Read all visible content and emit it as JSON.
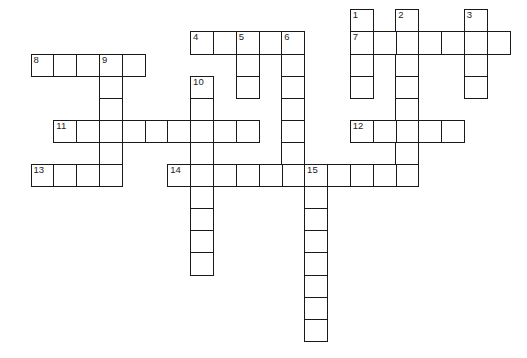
{
  "puzzle": {
    "grid": {
      "origin_x": 30.5,
      "origin_y": 9.3,
      "cell_width": 22.8,
      "cell_height": 22.1,
      "line_color": "#1a1a1a",
      "number_color": "#222222"
    },
    "entries": [
      {
        "number": "1",
        "direction": "down",
        "row": 0,
        "col": 14,
        "length": 4
      },
      {
        "number": "2",
        "direction": "down",
        "row": 0,
        "col": 16,
        "length": 8
      },
      {
        "number": "3",
        "direction": "down",
        "row": 0,
        "col": 19,
        "length": 4
      },
      {
        "number": "4",
        "direction": "across",
        "row": 1,
        "col": 7,
        "length": 5
      },
      {
        "number": "5",
        "direction": "down",
        "row": 1,
        "col": 9,
        "length": 3
      },
      {
        "number": "6",
        "direction": "down",
        "row": 1,
        "col": 11,
        "length": 7
      },
      {
        "number": "7",
        "direction": "across",
        "row": 1,
        "col": 14,
        "length": 7
      },
      {
        "number": "8",
        "direction": "across",
        "row": 2,
        "col": 0,
        "length": 5
      },
      {
        "number": "9",
        "direction": "down",
        "row": 2,
        "col": 3,
        "length": 6
      },
      {
        "number": "10",
        "direction": "down",
        "row": 3,
        "col": 7,
        "length": 9
      },
      {
        "number": "11",
        "direction": "across",
        "row": 5,
        "col": 1,
        "length": 9
      },
      {
        "number": "12",
        "direction": "across",
        "row": 5,
        "col": 14,
        "length": 5
      },
      {
        "number": "13",
        "direction": "across",
        "row": 7,
        "col": 0,
        "length": 4
      },
      {
        "number": "14",
        "direction": "across",
        "row": 7,
        "col": 6,
        "length": 11
      },
      {
        "number": "15",
        "direction": "down",
        "row": 7,
        "col": 12,
        "length": 8
      }
    ]
  }
}
